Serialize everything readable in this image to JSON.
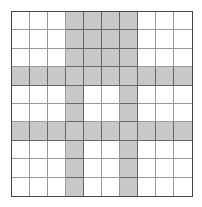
{
  "diagram": {
    "type": "grid",
    "rows": 10,
    "cols": 10,
    "colors": {
      "shaded": "#c8c8c8",
      "empty": "#ffffff",
      "border": "#444444",
      "gridline": "#999999"
    },
    "shaded_cells": [
      [
        0,
        0,
        0,
        1,
        1,
        1,
        1,
        0,
        0,
        0
      ],
      [
        0,
        0,
        0,
        1,
        1,
        1,
        1,
        0,
        0,
        0
      ],
      [
        0,
        0,
        0,
        1,
        1,
        1,
        1,
        0,
        0,
        0
      ],
      [
        1,
        1,
        1,
        1,
        1,
        1,
        1,
        1,
        1,
        1
      ],
      [
        0,
        0,
        0,
        1,
        0,
        0,
        1,
        0,
        0,
        0
      ],
      [
        0,
        0,
        0,
        1,
        0,
        0,
        1,
        0,
        0,
        0
      ],
      [
        1,
        1,
        1,
        1,
        1,
        1,
        1,
        1,
        1,
        1
      ],
      [
        0,
        0,
        0,
        1,
        0,
        0,
        1,
        0,
        0,
        0
      ],
      [
        0,
        0,
        0,
        1,
        0,
        0,
        1,
        0,
        0,
        0
      ],
      [
        0,
        0,
        0,
        1,
        0,
        0,
        1,
        0,
        0,
        0
      ]
    ]
  }
}
